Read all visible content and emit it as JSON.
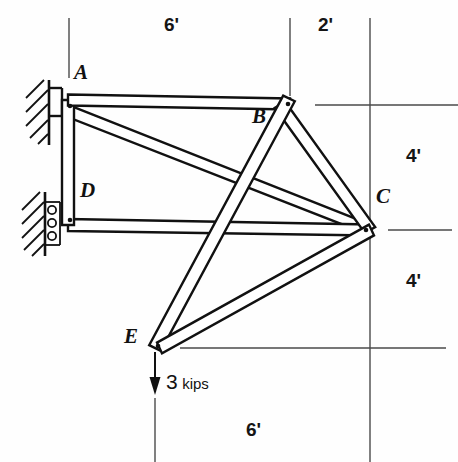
{
  "diagram": {
    "stroke_color": "#111111",
    "thin_color": "#4a4a4a",
    "background": "#fefefe",
    "nodes": [
      {
        "id": "A",
        "label": "A",
        "x": 68,
        "y": 100,
        "label_x": 74,
        "label_y": 72,
        "support": "pin"
      },
      {
        "id": "B",
        "label": "B",
        "x": 290,
        "y": 104,
        "label_x": 252,
        "label_y": 113,
        "support": "none"
      },
      {
        "id": "C",
        "label": "C",
        "x": 370,
        "y": 230,
        "label_x": 376,
        "label_y": 194,
        "support": "none"
      },
      {
        "id": "D",
        "label": "D",
        "x": 68,
        "y": 225,
        "label_x": 80,
        "label_y": 187,
        "support": "roller"
      },
      {
        "id": "E",
        "label": "E",
        "x": 155,
        "y": 348,
        "label_x": 126,
        "label_y": 331,
        "support": "none"
      }
    ],
    "members": [
      {
        "from": "A",
        "to": "B"
      },
      {
        "from": "B",
        "to": "C"
      },
      {
        "from": "A",
        "to": "D"
      },
      {
        "from": "D",
        "to": "C"
      },
      {
        "from": "A",
        "to": "C"
      },
      {
        "from": "B",
        "to": "E"
      },
      {
        "from": "C",
        "to": "E"
      }
    ],
    "load": {
      "at_node": "E",
      "magnitude": "3",
      "unit": "kips",
      "direction": "down",
      "arrow_x": 155,
      "arrow_y_start": 352,
      "arrow_y_end": 392,
      "text_x": 170,
      "text_y": 381
    },
    "dimensions": [
      {
        "name": "top-span-AB",
        "label": "6'",
        "text_x": 170,
        "text_y": 24,
        "orientation": "horizontal"
      },
      {
        "name": "top-span-BC",
        "label": "2'",
        "text_x": 322,
        "text_y": 24,
        "orientation": "horizontal"
      },
      {
        "name": "right-upper",
        "label": "4'",
        "text_x": 412,
        "text_y": 156,
        "orientation": "vertical"
      },
      {
        "name": "right-lower",
        "label": "4'",
        "text_x": 412,
        "text_y": 281,
        "orientation": "vertical"
      },
      {
        "name": "bottom-span",
        "label": "6'",
        "text_x": 252,
        "text_y": 430,
        "orientation": "horizontal"
      }
    ]
  }
}
